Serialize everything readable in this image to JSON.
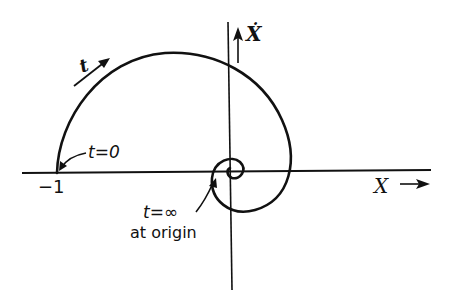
{
  "diagram": {
    "type": "phase-plane spiral trajectory",
    "axes": {
      "x_label": "X",
      "y_label": "Ẋ"
    },
    "labels": {
      "start_value": "−1",
      "t_label": "t",
      "t_zero": "t=0",
      "t_infinity": "t=∞",
      "at_origin": "at origin"
    },
    "colors": {
      "ink": "#111111",
      "background": "#ffffff"
    }
  }
}
